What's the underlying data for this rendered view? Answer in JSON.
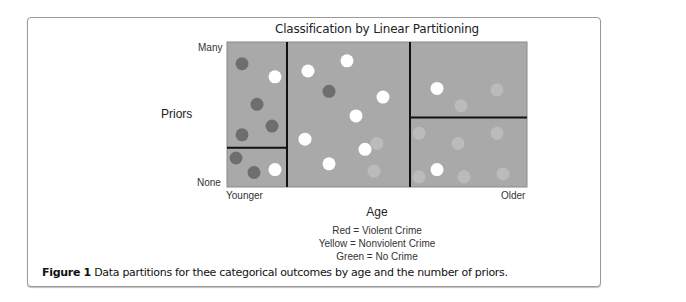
{
  "chart_data": {
    "type": "scatter",
    "title": "Classification by Linear Partitioning",
    "xlabel": "Age",
    "ylabel": "Priors",
    "x_ticks": [
      "Younger",
      "Older"
    ],
    "y_ticks": [
      "None",
      "Many"
    ],
    "xlim": [
      0,
      1
    ],
    "ylim": [
      0,
      1
    ],
    "legend": [
      "Red = Violent Crime",
      "Yellow = Nonviolent Crime",
      "Green = No Crime"
    ],
    "categories": {
      "violent": {
        "name": "Violent Crime",
        "color": "#6e6e6e"
      },
      "nonviolent": {
        "name": "Nonviolent Crime",
        "color": "#ffffff"
      },
      "none": {
        "name": "No Crime",
        "color": "#c2c2c2"
      }
    },
    "partitions": {
      "vertical_splits": [
        0.2,
        0.61
      ],
      "left_horizontal_split": 0.27,
      "right_horizontal_split": 0.48
    },
    "points": [
      {
        "x": 0.05,
        "y": 0.85,
        "class": "violent"
      },
      {
        "x": 0.16,
        "y": 0.76,
        "class": "nonviolent"
      },
      {
        "x": 0.1,
        "y": 0.57,
        "class": "violent"
      },
      {
        "x": 0.15,
        "y": 0.42,
        "class": "violent"
      },
      {
        "x": 0.05,
        "y": 0.36,
        "class": "violent"
      },
      {
        "x": 0.03,
        "y": 0.2,
        "class": "violent"
      },
      {
        "x": 0.09,
        "y": 0.1,
        "class": "violent"
      },
      {
        "x": 0.16,
        "y": 0.12,
        "class": "nonviolent"
      },
      {
        "x": 0.27,
        "y": 0.8,
        "class": "nonviolent"
      },
      {
        "x": 0.4,
        "y": 0.87,
        "class": "nonviolent"
      },
      {
        "x": 0.34,
        "y": 0.66,
        "class": "violent"
      },
      {
        "x": 0.52,
        "y": 0.62,
        "class": "nonviolent"
      },
      {
        "x": 0.43,
        "y": 0.49,
        "class": "nonviolent"
      },
      {
        "x": 0.26,
        "y": 0.33,
        "class": "nonviolent"
      },
      {
        "x": 0.46,
        "y": 0.26,
        "class": "nonviolent"
      },
      {
        "x": 0.34,
        "y": 0.16,
        "class": "nonviolent"
      },
      {
        "x": 0.5,
        "y": 0.3,
        "class": "none"
      },
      {
        "x": 0.49,
        "y": 0.11,
        "class": "none"
      },
      {
        "x": 0.7,
        "y": 0.68,
        "class": "nonviolent"
      },
      {
        "x": 0.78,
        "y": 0.56,
        "class": "none"
      },
      {
        "x": 0.9,
        "y": 0.67,
        "class": "none"
      },
      {
        "x": 0.64,
        "y": 0.37,
        "class": "none"
      },
      {
        "x": 0.77,
        "y": 0.3,
        "class": "none"
      },
      {
        "x": 0.9,
        "y": 0.37,
        "class": "none"
      },
      {
        "x": 0.7,
        "y": 0.12,
        "class": "nonviolent"
      },
      {
        "x": 0.64,
        "y": 0.07,
        "class": "none"
      },
      {
        "x": 0.79,
        "y": 0.07,
        "class": "none"
      },
      {
        "x": 0.92,
        "y": 0.09,
        "class": "none"
      }
    ]
  },
  "caption": {
    "label": "Figure 1",
    "text": " Data partitions for thee categorical outcomes by age and the number of priors."
  }
}
